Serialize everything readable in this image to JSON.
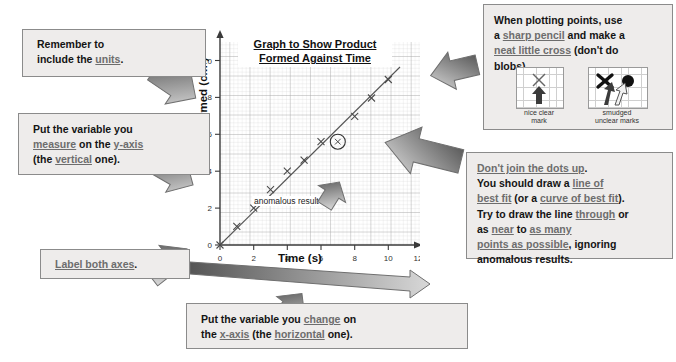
{
  "page": {
    "type": "science-revision-graph-annotation",
    "background": "#ffffff",
    "box_fill": "#eeeceb",
    "box_border": "#8b8b8b",
    "underline_color": "#6d6d6d"
  },
  "callouts": {
    "units": {
      "name": "remember-units",
      "lines": [
        [
          {
            "t": "Remember to",
            "u": false
          }
        ],
        [
          {
            "t": "include the ",
            "u": false
          },
          {
            "t": "units",
            "u": true
          },
          {
            "t": ".",
            "u": false
          }
        ]
      ]
    },
    "measure": {
      "name": "measure-y-axis",
      "lines": [
        [
          {
            "t": "Put the variable you",
            "u": false
          }
        ],
        [
          {
            "t": "measure",
            "u": true
          },
          {
            "t": " on the ",
            "u": false
          },
          {
            "t": "y-axis",
            "u": true
          }
        ],
        [
          {
            "t": "(the ",
            "u": false
          },
          {
            "t": "vertical",
            "u": true
          },
          {
            "t": " one).",
            "u": false
          }
        ]
      ]
    },
    "label_axes": {
      "name": "label-both-axes",
      "lines": [
        [
          {
            "t": "Label both axes",
            "u": true
          },
          {
            "t": ".",
            "u": false
          }
        ]
      ]
    },
    "xaxis": {
      "name": "change-x-axis",
      "lines": [
        [
          {
            "t": "Put the variable you ",
            "u": false
          },
          {
            "t": "change",
            "u": true
          },
          {
            "t": " on",
            "u": false
          }
        ],
        [
          {
            "t": "the ",
            "u": false
          },
          {
            "t": "x-axis",
            "u": true
          },
          {
            "t": " (the ",
            "u": false
          },
          {
            "t": "horizontal",
            "u": true
          },
          {
            "t": " one).",
            "u": false
          }
        ]
      ]
    },
    "plotting": {
      "name": "plotting-points",
      "lines": [
        [
          {
            "t": "When plotting points, use",
            "u": false
          }
        ],
        [
          {
            "t": "a ",
            "u": false
          },
          {
            "t": "sharp pencil",
            "u": true
          },
          {
            "t": " and make a",
            "u": false
          }
        ],
        [
          {
            "t": "neat little cross",
            "u": true
          },
          {
            "t": " (don't do",
            "u": false
          }
        ],
        [
          {
            "t": "blobs).",
            "u": false
          }
        ]
      ],
      "mini_good_caption": "nice clear\nmark",
      "mini_bad_caption": "smudged\nunclear marks"
    },
    "bestfit": {
      "name": "line-of-best-fit",
      "lines": [
        [
          {
            "t": "Don't join the dots up",
            "u": true
          },
          {
            "t": ".",
            "u": false
          }
        ],
        [
          {
            "t": "You should draw a ",
            "u": false
          },
          {
            "t": "line of",
            "u": true
          }
        ],
        [
          {
            "t": "best fit",
            "u": true
          },
          {
            "t": " (or a ",
            "u": false
          },
          {
            "t": "curve of best fit",
            "u": true
          },
          {
            "t": ").",
            "u": false
          }
        ],
        [
          {
            "t": "Try to draw the line ",
            "u": false
          },
          {
            "t": "through",
            "u": true
          },
          {
            "t": " or",
            "u": false
          }
        ],
        [
          {
            "t": "as ",
            "u": false
          },
          {
            "t": "near",
            "u": true
          },
          {
            "t": " to ",
            "u": false
          },
          {
            "t": "as many",
            "u": true
          }
        ],
        [
          {
            "t": "points as possible",
            "u": true
          },
          {
            "t": ", ignoring",
            "u": false
          }
        ],
        [
          {
            "t": "anomalous results.",
            "u": false
          }
        ]
      ]
    }
  },
  "chart_data": {
    "type": "scatter",
    "title": "Graph to Show Product Formed Against Time",
    "title_lines": [
      "Graph to Show Product",
      "Formed Against Time"
    ],
    "xlabel": "Time (s)",
    "ylabel": "Product formed (cm³)",
    "xlim": [
      0,
      12
    ],
    "ylim": [
      0,
      11
    ],
    "xticks": [
      0,
      2,
      4,
      6,
      8,
      10,
      12
    ],
    "xticklabels": [
      "0",
      "2",
      "4",
      "6",
      "8",
      "10",
      "12"
    ],
    "yticks": [
      0,
      2,
      4,
      6,
      8,
      10
    ],
    "yticklabels": [
      "0",
      "2",
      "4",
      "6",
      "8",
      "10"
    ],
    "grid": true,
    "grid_minor": true,
    "x": [
      0,
      1,
      2,
      3,
      4,
      5,
      6,
      7,
      8,
      9,
      10
    ],
    "y": [
      0,
      1,
      2,
      2.5,
      3.5,
      4,
      5,
      5,
      7,
      8,
      9
    ],
    "marker": "cross",
    "anomalous_point": {
      "x": 7,
      "y": 5,
      "label": "anomalous result",
      "circled": true
    },
    "best_fit_line": {
      "x0": 0,
      "y0": 0,
      "x1": 10.7,
      "y1": 9.6,
      "style": "solid"
    }
  }
}
